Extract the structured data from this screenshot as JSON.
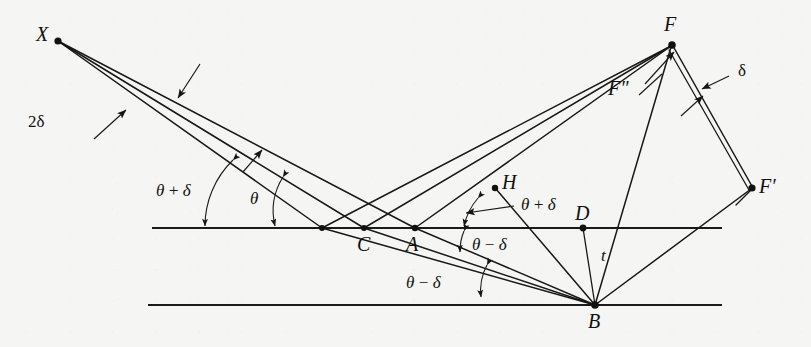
{
  "figure": {
    "background_color": "#f5f5f3",
    "ink_color": "#111111"
  },
  "points": [
    {
      "id": "X",
      "label": "X",
      "x": 58,
      "y": 41,
      "desc": "source point, upper left"
    },
    {
      "id": "C",
      "label": "C",
      "x": 364,
      "y": 228,
      "desc": "incidence point on top surface"
    },
    {
      "id": "A",
      "label": "A",
      "x": 415,
      "y": 228,
      "desc": "incidence point on top surface"
    },
    {
      "id": "H",
      "label": "H",
      "x": 495,
      "y": 188,
      "desc": "auxiliary point above top surface"
    },
    {
      "id": "D",
      "label": "D",
      "x": 583,
      "y": 228,
      "desc": "foot of thickness marker on top surface"
    },
    {
      "id": "B",
      "label": "B",
      "x": 595,
      "y": 305,
      "desc": "reflection point on bottom surface"
    },
    {
      "id": "F",
      "label": "F",
      "x": 672,
      "y": 45,
      "desc": "focus, upper right"
    },
    {
      "id": "Fpp",
      "label": "F″",
      "x": 622,
      "y": 87,
      "desc": "secondary focus label F double prime"
    },
    {
      "id": "Fp",
      "label": "F′",
      "x": 752,
      "y": 188,
      "desc": "focus F prime, lower right"
    }
  ],
  "labels": {
    "X": "X",
    "C": "C",
    "A": "A",
    "H": "H",
    "D": "D",
    "B": "B",
    "F": "F",
    "F_double_prime": "F″",
    "F_prime": "F′",
    "t": "t",
    "two_delta": "2δ",
    "delta": "δ",
    "theta": "θ",
    "theta_plus_delta_left": "θ + δ",
    "theta_plus_delta_mid": "θ + δ",
    "theta_minus_delta_upper": "θ − δ",
    "theta_minus_delta_lower": "θ − δ"
  },
  "annotations": [
    {
      "name": "two-delta",
      "text": "2δ",
      "x": 41,
      "y": 122,
      "desc": "angular spread of incident beam"
    },
    {
      "name": "theta-plus-delta-left",
      "text": "θ + δ",
      "x": 163,
      "y": 191,
      "desc": "incidence angle of upper ray at top surface"
    },
    {
      "name": "theta",
      "text": "θ",
      "x": 256,
      "y": 199,
      "desc": "incidence angle of central ray"
    },
    {
      "name": "theta-plus-delta-mid",
      "text": "θ + δ",
      "x": 520,
      "y": 205,
      "desc": "angle at A between AH and surface"
    },
    {
      "name": "theta-minus-delta-upper",
      "text": "θ − δ",
      "x": 470,
      "y": 243,
      "desc": "refraction angle at A below surface"
    },
    {
      "name": "theta-minus-delta-lower",
      "text": "θ − δ",
      "x": 440,
      "y": 283,
      "desc": "angle of ray A-B measured near bottom"
    },
    {
      "name": "delta",
      "text": "δ",
      "x": 734,
      "y": 73,
      "desc": "angle between the two rays leaving F toward F prime"
    },
    {
      "name": "thickness-t",
      "text": "t",
      "x": 590,
      "y": 258,
      "desc": "plate thickness between D and B"
    }
  ],
  "surfaces": [
    {
      "name": "top-surface",
      "x1": 152,
      "y1": 228,
      "x2": 722,
      "y2": 228
    },
    {
      "name": "bottom-surface",
      "x1": 148,
      "y1": 305,
      "x2": 722,
      "y2": 305
    }
  ],
  "geometry": {
    "incident_rays": [
      {
        "from": [
          58,
          41
        ],
        "to": [
          322,
          228
        ]
      },
      {
        "from": [
          58,
          41
        ],
        "to": [
          364,
          228
        ]
      },
      {
        "from": [
          58,
          41
        ],
        "to": [
          415,
          228
        ]
      }
    ],
    "reflected_rays": [
      {
        "from": [
          322,
          228
        ],
        "to": [
          672,
          45
        ]
      },
      {
        "from": [
          364,
          228
        ],
        "to": [
          672,
          45
        ]
      },
      {
        "from": [
          415,
          228
        ],
        "to": [
          672,
          45
        ]
      }
    ],
    "internal_rays": [
      {
        "from": [
          415,
          228
        ],
        "to": [
          595,
          305
        ]
      },
      {
        "from": [
          364,
          228
        ],
        "to": [
          595,
          305
        ]
      },
      {
        "from": [
          322,
          228
        ],
        "to": [
          595,
          305
        ]
      }
    ],
    "outgoing_from_B": [
      {
        "from": [
          595,
          305
        ],
        "to": [
          672,
          45
        ]
      },
      {
        "from": [
          595,
          305
        ],
        "to": [
          495,
          188
        ]
      },
      {
        "from": [
          595,
          305
        ],
        "to": [
          752,
          188
        ]
      }
    ],
    "thickness_marker": {
      "from": [
        583,
        228
      ],
      "to": [
        595,
        305
      ]
    },
    "focus_edges": [
      {
        "from": [
          672,
          45
        ],
        "to": [
          752,
          188
        ]
      },
      {
        "from": [
          680,
          47
        ],
        "to": [
          754,
          190
        ]
      }
    ],
    "arrow_leaders": [
      {
        "name": "two-delta-upper-arrow",
        "from": [
          198,
          66
        ],
        "to": [
          178,
          96
        ]
      },
      {
        "name": "two-delta-lower-arrow",
        "from": [
          96,
          136
        ],
        "to": [
          124,
          112
        ]
      },
      {
        "name": "theta-plus-delta-mid-arrow",
        "from": [
          512,
          208
        ],
        "to": [
          466,
          213
        ]
      },
      {
        "name": "delta-arrow",
        "from": [
          726,
          77
        ],
        "to": [
          700,
          89
        ]
      },
      {
        "name": "f-double-prime-arrow",
        "from": [
          646,
          83
        ],
        "to": [
          673,
          53
        ]
      },
      {
        "name": "f-double-prime-leader",
        "from": [
          641,
          92
        ],
        "to": [
          676,
          64
        ]
      },
      {
        "name": "inner-wedge-arrow",
        "from": [
          680,
          112
        ],
        "to": [
          700,
          96
        ]
      }
    ]
  }
}
